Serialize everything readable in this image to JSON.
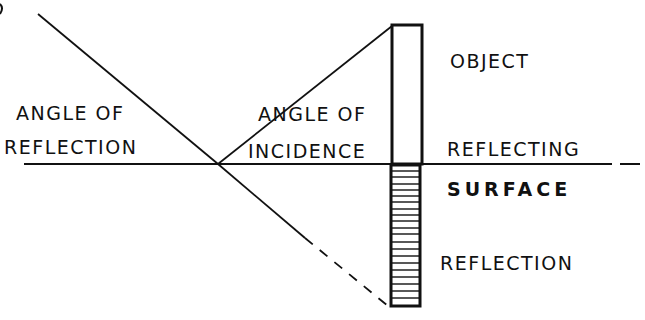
{
  "diagram": {
    "title": "",
    "colors": {
      "ink": "#111111",
      "background": "#ffffff"
    },
    "labels": {
      "angle_of_reflection": {
        "line1": "ANGLE OF",
        "line2": "REFLECTION"
      },
      "angle_of_incidence": {
        "line1": "ANGLE OF",
        "line2": "INCIDENCE"
      },
      "object": "OBJECT",
      "reflecting_surface": {
        "line1": "REFLECTING",
        "line2": "SURFACE"
      },
      "reflection": "REFLECTION"
    },
    "elements": {
      "reflecting_surface_line": {
        "x1": 24,
        "y1": 164,
        "x2": 612,
        "y2": 164
      },
      "surface_dash": {
        "x1": 620,
        "y1": 164,
        "x2": 640,
        "y2": 164
      },
      "reflection_point": {
        "x": 218,
        "y": 164
      },
      "incident_ray": {
        "x1": 218,
        "y1": 164,
        "x2": 392,
        "y2": 26
      },
      "reflected_ray": {
        "x1": 38,
        "y1": 14,
        "x2": 218,
        "y2": 164
      },
      "virtual_ray_solid": {
        "x1": 218,
        "y1": 164,
        "x2": 305,
        "y2": 238
      },
      "virtual_ray_dashed": {
        "x1": 305,
        "y1": 238,
        "x2": 388,
        "y2": 306
      },
      "object_box": {
        "x": 392,
        "y": 25,
        "width": 30,
        "height": 139
      },
      "reflection_box": {
        "x": 391,
        "y": 165,
        "width": 29,
        "height": 141,
        "hatch_lines": 20
      }
    }
  }
}
